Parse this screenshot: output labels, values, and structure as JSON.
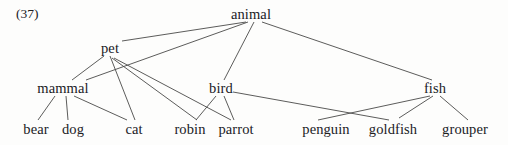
{
  "figure": {
    "example_number": "(37)",
    "type": "multidomination-tree-diagram",
    "line_color": "#4a4a48",
    "text_color": "#20201f",
    "background_color": "#fdfdfc"
  },
  "nodes": [
    {
      "id": "animal",
      "label": "animal",
      "x": 251,
      "y": 14,
      "level": 0
    },
    {
      "id": "pet",
      "label": "pet",
      "x": 110,
      "y": 48,
      "level": 1
    },
    {
      "id": "mammal",
      "label": "mammal",
      "x": 63,
      "y": 88,
      "level": 2
    },
    {
      "id": "bird",
      "label": "bird",
      "x": 221,
      "y": 88,
      "level": 2
    },
    {
      "id": "fish",
      "label": "fish",
      "x": 435,
      "y": 88,
      "level": 2
    },
    {
      "id": "bear",
      "label": "bear",
      "x": 36,
      "y": 129,
      "level": 3
    },
    {
      "id": "dog",
      "label": "dog",
      "x": 73,
      "y": 129,
      "level": 3
    },
    {
      "id": "cat",
      "label": "cat",
      "x": 134,
      "y": 129,
      "level": 3
    },
    {
      "id": "robin",
      "label": "robin",
      "x": 190,
      "y": 129,
      "level": 3
    },
    {
      "id": "parrot",
      "label": "parrot",
      "x": 236,
      "y": 129,
      "level": 3
    },
    {
      "id": "penguin",
      "label": "penguin",
      "x": 326,
      "y": 129,
      "level": 3
    },
    {
      "id": "goldfish",
      "label": "goldfish",
      "x": 393,
      "y": 129,
      "level": 3
    },
    {
      "id": "grouper",
      "label": "grouper",
      "x": 465,
      "y": 129,
      "level": 3
    }
  ],
  "edges": [
    {
      "from": "animal",
      "to": "pet",
      "x1": 246,
      "y1": 22,
      "x2": 122,
      "y2": 41
    },
    {
      "from": "animal",
      "to": "mammal",
      "x1": 248,
      "y1": 22,
      "x2": 86,
      "y2": 80
    },
    {
      "from": "animal",
      "to": "bird",
      "x1": 254,
      "y1": 22,
      "x2": 224,
      "y2": 80
    },
    {
      "from": "animal",
      "to": "fish",
      "x1": 262,
      "y1": 22,
      "x2": 432,
      "y2": 80
    },
    {
      "from": "pet",
      "to": "mammal",
      "x1": 104,
      "y1": 56,
      "x2": 72,
      "y2": 80
    },
    {
      "from": "pet",
      "to": "cat",
      "x1": 110,
      "y1": 56,
      "x2": 135,
      "y2": 120
    },
    {
      "from": "pet",
      "to": "robin",
      "x1": 112,
      "y1": 58,
      "x2": 197,
      "y2": 120
    },
    {
      "from": "pet",
      "to": "parrot",
      "x1": 114,
      "y1": 58,
      "x2": 231,
      "y2": 120
    },
    {
      "from": "mammal",
      "to": "bear",
      "x1": 55,
      "y1": 96,
      "x2": 38,
      "y2": 120
    },
    {
      "from": "mammal",
      "to": "dog",
      "x1": 66,
      "y1": 96,
      "x2": 68,
      "y2": 120
    },
    {
      "from": "mammal",
      "to": "cat",
      "x1": 74,
      "y1": 96,
      "x2": 127,
      "y2": 120
    },
    {
      "from": "bird",
      "to": "robin",
      "x1": 216,
      "y1": 96,
      "x2": 196,
      "y2": 120
    },
    {
      "from": "bird",
      "to": "parrot",
      "x1": 224,
      "y1": 96,
      "x2": 234,
      "y2": 120
    },
    {
      "from": "bird",
      "to": "goldfish",
      "x1": 233,
      "y1": 92,
      "x2": 389,
      "y2": 120
    },
    {
      "from": "fish",
      "to": "penguin",
      "x1": 430,
      "y1": 96,
      "x2": 318,
      "y2": 120
    },
    {
      "from": "fish",
      "to": "goldfish",
      "x1": 433,
      "y1": 96,
      "x2": 399,
      "y2": 118
    },
    {
      "from": "fish",
      "to": "grouper",
      "x1": 440,
      "y1": 96,
      "x2": 468,
      "y2": 120
    }
  ]
}
